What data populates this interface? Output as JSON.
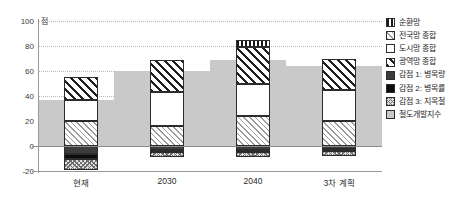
{
  "chart_data": {
    "type": "bar",
    "title": "",
    "subtitle": "",
    "xlabel": "",
    "ylabel": "점",
    "unit_label": "점",
    "ylim": [
      -20,
      100
    ],
    "yticks": [
      100,
      80,
      60,
      40,
      20,
      0,
      -20
    ],
    "ytick_labels": [
      "100",
      "80",
      "60",
      "40",
      "20",
      "0",
      "-20"
    ],
    "grid": true,
    "legend_position": "right",
    "stacked": true,
    "categories": [
      "현재",
      "2030",
      "2040",
      "3차 계획"
    ],
    "series": [
      {
        "name": "순환망",
        "key": "circular_network",
        "pattern": "vertical-stripes",
        "values": [
          0,
          0,
          5,
          0
        ]
      },
      {
        "name": "전국망 종합",
        "key": "national_network",
        "pattern": "fine-diagonal",
        "values": [
          0,
          0,
          0,
          0
        ]
      },
      {
        "name": "도시망 종합",
        "key": "urban_network",
        "pattern": "white",
        "values": [
          17,
          20,
          22,
          20
        ]
      },
      {
        "name": "광역망 종합",
        "key": "metropolitan_network",
        "pattern": "bold-diagonal",
        "values": [
          18,
          26,
          28,
          24
        ]
      },
      {
        "name": "감점 1: 병목량",
        "key": "penalty_bottleneck_vol",
        "pattern": "dark-gray",
        "values": [
          -6,
          -3,
          -3,
          -2
        ]
      },
      {
        "name": "감점 2: 병목률",
        "key": "penalty_bottleneck_rate",
        "pattern": "black",
        "values": [
          -4,
          -2,
          -3,
          -2
        ]
      },
      {
        "name": "감점 3: 지옥철",
        "key": "penalty_hell_subway",
        "pattern": "checker",
        "values": [
          -9,
          -5,
          -5,
          -5
        ]
      },
      {
        "name": "철도개발지수",
        "key": "rail_development_index",
        "pattern": "solid-gray",
        "values": [
          37,
          60,
          69,
          64
        ]
      }
    ],
    "bar_segments": [
      {
        "category": "현재",
        "positive": [
          {
            "name": "광역망 종합",
            "pattern": "bold-diagonal",
            "from": 37,
            "to": 55
          },
          {
            "name": "도시망 종합",
            "pattern": "white",
            "from": 20,
            "to": 37
          },
          {
            "name": "전국망 종합",
            "pattern": "fine-diagonal",
            "from": 0,
            "to": 20
          }
        ],
        "negative": [
          {
            "name": "감점 1: 병목량",
            "pattern": "dark-gray",
            "from": -6,
            "to": 0
          },
          {
            "name": "감점 2: 병목률",
            "pattern": "black",
            "from": -10,
            "to": -6
          },
          {
            "name": "감점 3: 지옥철",
            "pattern": "checker",
            "from": -19,
            "to": -10
          }
        ]
      },
      {
        "category": "2030",
        "positive": [
          {
            "name": "광역망 종합",
            "pattern": "bold-diagonal",
            "from": 43,
            "to": 69
          },
          {
            "name": "도시망 종합",
            "pattern": "white",
            "from": 16,
            "to": 43
          },
          {
            "name": "전국망 종합",
            "pattern": "fine-diagonal",
            "from": 0,
            "to": 16
          }
        ],
        "negative": [
          {
            "name": "감점 1: 병목량",
            "pattern": "dark-gray",
            "from": -3,
            "to": 0
          },
          {
            "name": "감점 2: 병목률",
            "pattern": "black",
            "from": -5,
            "to": -3
          },
          {
            "name": "감점 3: 지옥철",
            "pattern": "checker",
            "from": -9,
            "to": -5
          }
        ]
      },
      {
        "category": "2040",
        "positive": [
          {
            "name": "순환망",
            "pattern": "vertical-stripes",
            "from": 79,
            "to": 85
          },
          {
            "name": "광역망 종합",
            "pattern": "bold-diagonal",
            "from": 50,
            "to": 79
          },
          {
            "name": "도시망 종합",
            "pattern": "white",
            "from": 24,
            "to": 50
          },
          {
            "name": "전국망 종합",
            "pattern": "fine-diagonal",
            "from": 0,
            "to": 24
          }
        ],
        "negative": [
          {
            "name": "감점 1: 병목량",
            "pattern": "dark-gray",
            "from": -3,
            "to": 0
          },
          {
            "name": "감점 2: 병목률",
            "pattern": "black",
            "from": -5,
            "to": -3
          },
          {
            "name": "감점 3: 지옥철",
            "pattern": "checker",
            "from": -9,
            "to": -5
          }
        ]
      },
      {
        "category": "3차 계획",
        "positive": [
          {
            "name": "광역망 종합",
            "pattern": "bold-diagonal",
            "from": 45,
            "to": 70
          },
          {
            "name": "도시망 종합",
            "pattern": "white",
            "from": 20,
            "to": 45
          },
          {
            "name": "전국망 종합",
            "pattern": "fine-diagonal",
            "from": 0,
            "to": 20
          }
        ],
        "negative": [
          {
            "name": "감점 1: 병목량",
            "pattern": "dark-gray",
            "from": -2,
            "to": 0
          },
          {
            "name": "감점 2: 병목률",
            "pattern": "black",
            "from": -4,
            "to": -2
          },
          {
            "name": "감점 3: 지옥철",
            "pattern": "checker",
            "from": -8,
            "to": -4
          }
        ]
      }
    ],
    "step_area": {
      "name": "철도개발지수",
      "pattern": "solid-gray",
      "steps": [
        {
          "from_x": 0.0,
          "to_x": 0.22,
          "value": 37
        },
        {
          "from_x": 0.22,
          "to_x": 0.5,
          "value": 60
        },
        {
          "from_x": 0.5,
          "to_x": 0.72,
          "value": 69
        },
        {
          "from_x": 0.72,
          "to_x": 1.0,
          "value": 64
        }
      ]
    },
    "legend": [
      {
        "label": "순환망",
        "pattern": "vertical-stripes"
      },
      {
        "label": "전국망 종합",
        "pattern": "fine-diagonal"
      },
      {
        "label": "도시망 종합",
        "pattern": "white"
      },
      {
        "label": "광역망 종합",
        "pattern": "bold-diagonal"
      },
      {
        "label": "감점 1: 병목량",
        "pattern": "dark-gray"
      },
      {
        "label": "감점 2: 병목률",
        "pattern": "black"
      },
      {
        "label": "감점 3: 지옥철",
        "pattern": "checker"
      },
      {
        "label": "철도개발지수",
        "pattern": "solid-gray"
      }
    ],
    "colors": {
      "index_gray": "#c9c9c9",
      "penalty_dark": "#3c3c3c",
      "penalty_black": "#0d0d0d",
      "gridline": "#b9b9b9",
      "axis": "#9a9a9a",
      "text": "#2b2b2b"
    }
  }
}
